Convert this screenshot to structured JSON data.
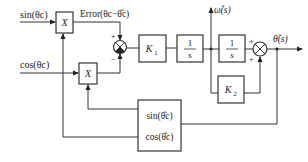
{
  "diagram": {
    "type": "block-diagram",
    "inputs": {
      "sin_input": "sin(θc)",
      "cos_input": "cos(θc)"
    },
    "signals": {
      "error": "Error(θc−θ̂c)",
      "omega_hat": "ω̂(s)",
      "theta_hat": "θ̂(s)"
    },
    "blocks": {
      "mult1": "X",
      "mult2": "X",
      "k1": "K",
      "k1_sub": "1",
      "integrator1_num": "1",
      "integrator1_den": "s",
      "integrator2_num": "1",
      "integrator2_den": "s",
      "k2": "K",
      "k2_sub": "2",
      "trig_sin": "sin(θ̂c)",
      "trig_cos": "cos(θ̂c)"
    },
    "summer1_signs": {
      "top": "+",
      "bottom": "−"
    },
    "summer2_signs": {
      "left": "+",
      "bottom": "+"
    },
    "colors": {
      "line": "#333333",
      "background": "#ffffff"
    }
  }
}
